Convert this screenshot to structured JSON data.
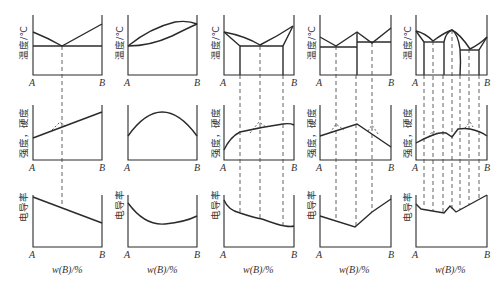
{
  "figure": {
    "rows": {
      "temperature": {
        "ylabel": "温度/℃"
      },
      "strength": {
        "ylabel": "强度，硬度"
      },
      "conductivity": {
        "ylabel": "电导率"
      }
    },
    "axis_ticks": {
      "left": "A",
      "right": "B"
    },
    "xlabel": "w(B)/%",
    "panels": [
      {
        "id": 1,
        "type": "eutectic (simple)",
        "top_ylabel": "温度/℃",
        "mid_ylabel": "强度，硬度",
        "bot_ylabel": "电导率",
        "left_tick": "A",
        "right_tick": "B",
        "xlabel": "w(B)/%"
      },
      {
        "id": 2,
        "type": "isomorphous (continuous solid solution)",
        "top_ylabel": "温度/℃",
        "mid_ylabel": "强度，硬度",
        "bot_ylabel": "电导率",
        "left_tick": "A",
        "right_tick": "B",
        "xlabel": "w(B)/%"
      },
      {
        "id": 3,
        "type": "eutectic with limited solubility",
        "top_ylabel": "温度/℃",
        "mid_ylabel": "强度，硬度",
        "bot_ylabel": "电导率",
        "left_tick": "A",
        "right_tick": "B",
        "xlabel": "w(B)/%"
      },
      {
        "id": 4,
        "type": "with stable intermediate compound",
        "top_ylabel": "温度/℃",
        "mid_ylabel": "强度，硬度",
        "bot_ylabel": "电导率",
        "left_tick": "A",
        "right_tick": "B",
        "xlabel": "w(B)/%"
      },
      {
        "id": 5,
        "type": "intermediate phase with solid solubility",
        "top_ylabel": "温度/℃",
        "mid_ylabel": "强度，硬度",
        "bot_ylabel": "电导率",
        "left_tick": "A",
        "right_tick": "B",
        "xlabel": "w(B)/%"
      }
    ]
  },
  "colors": {
    "line": "#2a2a2a",
    "background": "#ffffff"
  }
}
